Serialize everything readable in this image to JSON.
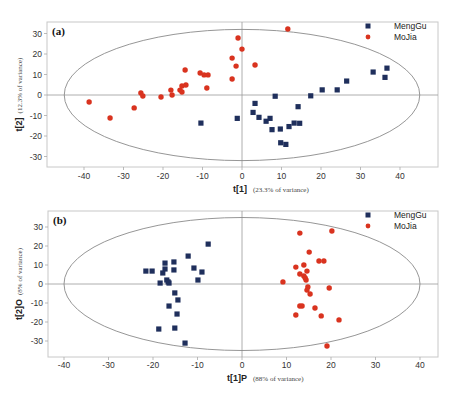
{
  "chart_data": [
    {
      "type": "scatter",
      "panel_label": "(a)",
      "title": "",
      "xlabel": "t[1]",
      "xlabel_note": "(23.3% of variance)",
      "ylabel": "t[2]",
      "ylabel_note": "(12.3% of variance)",
      "xlim": [
        -48,
        48
      ],
      "ylim": [
        -36,
        36
      ],
      "xticks": [
        -40,
        -30,
        -20,
        -10,
        0,
        10,
        20,
        30,
        40
      ],
      "yticks": [
        30,
        20,
        10,
        0,
        -10,
        -20,
        -30
      ],
      "ellipse": {
        "cx": 0,
        "cy": 0,
        "rx": 45,
        "ry": 32
      },
      "legend_position": "upper right",
      "grid": false,
      "series": [
        {
          "name": "MengGu",
          "marker": "square",
          "color": "#1f2f5c",
          "points": [
            [
              -10.4,
              -13.7
            ],
            [
              -1.2,
              -11.4
            ],
            [
              3.3,
              -4.1
            ],
            [
              2.8,
              -8.5
            ],
            [
              4.3,
              -10.9
            ],
            [
              6.1,
              -12.8
            ],
            [
              7.1,
              -11.4
            ],
            [
              7.6,
              -16.9
            ],
            [
              9.7,
              -16.6
            ],
            [
              9.8,
              -23.3
            ],
            [
              11.1,
              -24.1
            ],
            [
              8.4,
              -0.6
            ],
            [
              11.9,
              -15.4
            ],
            [
              13.2,
              -13.7
            ],
            [
              14.6,
              -13.8
            ],
            [
              14.2,
              -5.7
            ],
            [
              17.4,
              -0.4
            ],
            [
              20.3,
              2.5
            ],
            [
              24.1,
              2.5
            ],
            [
              26.5,
              6.8
            ],
            [
              33.2,
              11.2
            ],
            [
              36.2,
              8.6
            ],
            [
              36.7,
              13.1
            ]
          ]
        },
        {
          "name": "MoJia",
          "marker": "circle",
          "color": "#d9331f",
          "points": [
            [
              -38.7,
              -3.4
            ],
            [
              -33.4,
              -11.2
            ],
            [
              -27.3,
              -6.3
            ],
            [
              -25.6,
              1.0
            ],
            [
              -25.1,
              -0.5
            ],
            [
              -20.5,
              -1.0
            ],
            [
              -18.0,
              2.4
            ],
            [
              -17.7,
              0.0
            ],
            [
              -15.7,
              2.4
            ],
            [
              -15.2,
              4.4
            ],
            [
              -15.2,
              1.5
            ],
            [
              -14.2,
              4.9
            ],
            [
              -14.4,
              12.2
            ],
            [
              -10.6,
              10.7
            ],
            [
              -9.6,
              9.8
            ],
            [
              -8.6,
              9.8
            ],
            [
              -8.9,
              3.4
            ],
            [
              -1.0,
              27.8
            ],
            [
              0.0,
              22.4
            ],
            [
              -2.5,
              18.0
            ],
            [
              -1.5,
              14.1
            ],
            [
              -2.5,
              7.8
            ],
            [
              3.3,
              14.6
            ],
            [
              11.6,
              32.2
            ]
          ]
        }
      ]
    },
    {
      "type": "scatter",
      "panel_label": "(b)",
      "title": "",
      "xlabel": "t[1]P",
      "xlabel_note": "(88% of variance)",
      "ylabel": "t[2]O",
      "ylabel_note": "(8% of variance)",
      "xlim": [
        -44,
        44
      ],
      "ylim": [
        -38,
        38
      ],
      "xticks": [
        -40,
        -30,
        -20,
        -10,
        0,
        10,
        20,
        30,
        40
      ],
      "yticks": [
        30,
        20,
        10,
        0,
        -10,
        -20,
        -30
      ],
      "ellipse": {
        "cx": 0,
        "cy": 0,
        "rx": 40,
        "ry": 35
      },
      "legend_position": "upper right",
      "grid": false,
      "series": [
        {
          "name": "MengGu",
          "marker": "square",
          "color": "#1f2f5c",
          "points": [
            [
              -21.6,
              6.8
            ],
            [
              -20.2,
              6.8
            ],
            [
              -17.3,
              11.0
            ],
            [
              -17.3,
              7.9
            ],
            [
              -17.8,
              5.8
            ],
            [
              -15.3,
              11.6
            ],
            [
              -15.3,
              7.4
            ],
            [
              -12.1,
              14.7
            ],
            [
              -7.6,
              21.0
            ],
            [
              -10.8,
              8.4
            ],
            [
              -9.0,
              6.3
            ],
            [
              -9.9,
              2.1
            ],
            [
              -16.9,
              2.1
            ],
            [
              -16.6,
              1.1
            ],
            [
              -16.4,
              0.5
            ],
            [
              -18.4,
              0.5
            ],
            [
              -15.1,
              -4.7
            ],
            [
              -14.4,
              -8.4
            ],
            [
              -16.4,
              -11.6
            ],
            [
              -14.6,
              -15.8
            ],
            [
              -18.7,
              -23.7
            ],
            [
              -15.1,
              -23.2
            ],
            [
              -12.8,
              -31.1
            ]
          ]
        },
        {
          "name": "MoJia",
          "marker": "circle",
          "color": "#d9331f",
          "points": [
            [
              13.0,
              26.8
            ],
            [
              20.2,
              27.9
            ],
            [
              15.1,
              16.8
            ],
            [
              17.3,
              12.1
            ],
            [
              18.4,
              12.1
            ],
            [
              12.1,
              8.9
            ],
            [
              13.9,
              10.0
            ],
            [
              14.6,
              6.8
            ],
            [
              13.0,
              5.3
            ],
            [
              13.9,
              4.2
            ],
            [
              14.2,
              3.2
            ],
            [
              14.4,
              2.1
            ],
            [
              9.2,
              1.1
            ],
            [
              14.8,
              -1.6
            ],
            [
              14.6,
              -3.2
            ],
            [
              19.6,
              -2.1
            ],
            [
              15.3,
              -5.3
            ],
            [
              13.0,
              -11.6
            ],
            [
              13.5,
              -11.6
            ],
            [
              16.4,
              -12.6
            ],
            [
              12.1,
              -16.3
            ],
            [
              17.8,
              -16.8
            ],
            [
              21.8,
              -18.9
            ],
            [
              19.1,
              -32.6
            ]
          ]
        }
      ]
    }
  ],
  "layout": [
    {
      "frame": {
        "left": 47,
        "top": 22,
        "right": 438,
        "bottom": 167
      },
      "x0px": 242,
      "xscale": 3.95,
      "y0px": 95,
      "yscale": 2.05,
      "tick_y": 179,
      "xlabel_y": 192,
      "ylabel_x": 22
    },
    {
      "frame": {
        "left": 48,
        "top": 211,
        "right": 438,
        "bottom": 357
      },
      "x0px": 242,
      "xscale": 4.45,
      "y0px": 284,
      "yscale": 1.9,
      "tick_y": 368,
      "xlabel_y": 381,
      "ylabel_x": 22
    }
  ]
}
